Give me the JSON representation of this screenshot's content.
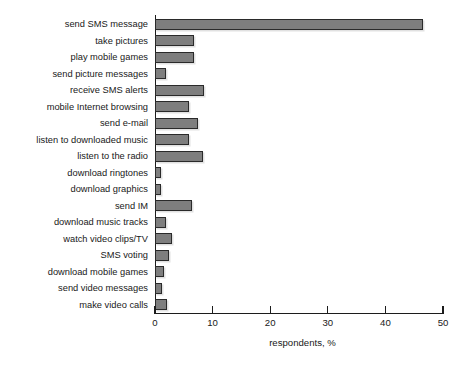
{
  "chart_data": {
    "type": "bar",
    "orientation": "horizontal",
    "title": "",
    "xlabel": "respondents, %",
    "ylabel": "",
    "xlim": [
      0,
      50
    ],
    "xticks": [
      0,
      10,
      20,
      30,
      40,
      50
    ],
    "grid": false,
    "legend": null,
    "bar_color": "#7e7e7e",
    "bar_edge_color": "#2a2a2a",
    "background_color": "#ffffff",
    "categories": [
      "send SMS message",
      "take pictures",
      "play mobile games",
      "send picture messages",
      "receive SMS alerts",
      "mobile Internet browsing",
      "send e-mail",
      "listen to downloaded music",
      "listen to the radio",
      "download ringtones",
      "download graphics",
      "send IM",
      "download music tracks",
      "watch video clips/TV",
      "SMS voting",
      "download mobile games",
      "send video messages",
      "make video calls"
    ],
    "values": [
      46.5,
      6.8,
      6.8,
      1.9,
      8.5,
      5.9,
      7.4,
      5.9,
      8.3,
      1.0,
      1.0,
      6.5,
      1.9,
      3.0,
      2.4,
      1.6,
      1.2,
      2.0
    ]
  }
}
